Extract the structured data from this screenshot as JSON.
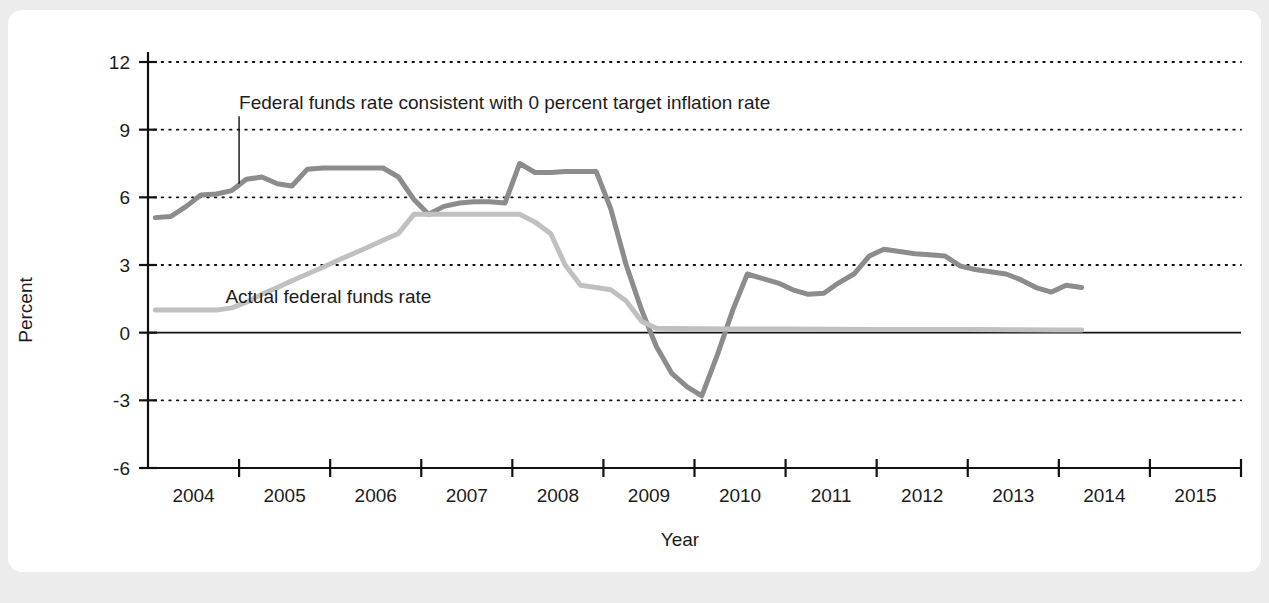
{
  "chart_data": {
    "type": "line",
    "title": "",
    "xlabel": "Year",
    "ylabel": "Percent",
    "grid": true,
    "legend_position": "inline-annotation",
    "xlim": [
      2003.5,
      2015.5
    ],
    "ylim": [
      -6,
      12
    ],
    "x_tick_labels": [
      "2004",
      "2005",
      "2006",
      "2007",
      "2008",
      "2009",
      "2010",
      "2011",
      "2012",
      "2013",
      "2014",
      "2015"
    ],
    "y_tick_labels": [
      "12",
      "9",
      "6",
      "3",
      "0",
      "-3",
      "-6"
    ],
    "y_ticks": [
      12,
      9,
      6,
      3,
      0,
      -3,
      -6
    ],
    "zero_line": 0,
    "series": [
      {
        "name": "Federal funds rate consistent with 0 percent target inflation rate",
        "color": "#8c8c8c",
        "label_x": 2004.5,
        "label_y": 10.2,
        "leader_from": [
          2004.5,
          9.6
        ],
        "leader_to": [
          2004.5,
          6.6
        ],
        "x": [
          2003.58,
          2003.75,
          2003.92,
          2004.08,
          2004.25,
          2004.42,
          2004.58,
          2004.75,
          2004.92,
          2005.08,
          2005.25,
          2005.42,
          2005.58,
          2005.75,
          2005.92,
          2006.08,
          2006.25,
          2006.42,
          2006.58,
          2006.75,
          2006.92,
          2007.08,
          2007.25,
          2007.42,
          2007.58,
          2007.75,
          2007.92,
          2008.08,
          2008.25,
          2008.42,
          2008.58,
          2008.75,
          2008.92,
          2009.08,
          2009.25,
          2009.42,
          2009.58,
          2009.75,
          2009.92,
          2010.08,
          2010.25,
          2010.42,
          2010.58,
          2010.75,
          2010.92,
          2011.08,
          2011.25,
          2011.42,
          2011.58,
          2011.75,
          2011.92,
          2012.08,
          2012.25,
          2012.42,
          2012.58,
          2012.75,
          2012.92,
          2013.08,
          2013.25,
          2013.42,
          2013.58,
          2013.75
        ],
        "y": [
          5.1,
          5.15,
          5.6,
          6.1,
          6.15,
          6.3,
          6.8,
          6.9,
          6.6,
          6.5,
          7.25,
          7.3,
          7.3,
          7.3,
          7.3,
          7.3,
          6.9,
          5.9,
          5.25,
          5.6,
          5.75,
          5.8,
          5.8,
          5.75,
          7.5,
          7.1,
          7.1,
          7.15,
          7.15,
          7.15,
          5.5,
          3.0,
          1.0,
          -0.6,
          -1.8,
          -2.4,
          -2.8,
          -1.0,
          1.0,
          2.6,
          2.4,
          2.2,
          1.9,
          1.7,
          1.75,
          2.2,
          2.6,
          3.4,
          3.7,
          3.6,
          3.5,
          3.45,
          3.4,
          2.95,
          2.8,
          2.7,
          2.6,
          2.35,
          2.0,
          1.8,
          2.1,
          2.0
        ]
      },
      {
        "name": "Actual federal funds rate",
        "color": "#c0c0c0",
        "label_x": 2004.35,
        "label_y": 1.6,
        "x": [
          2003.58,
          2003.92,
          2004.25,
          2004.42,
          2004.58,
          2004.75,
          2004.92,
          2005.08,
          2005.25,
          2005.42,
          2005.58,
          2005.75,
          2005.92,
          2006.08,
          2006.25,
          2006.42,
          2006.58,
          2006.75,
          2006.92,
          2007.08,
          2007.25,
          2007.42,
          2007.58,
          2007.75,
          2007.92,
          2008.08,
          2008.25,
          2008.42,
          2008.58,
          2008.75,
          2008.92,
          2009.08,
          2009.5,
          2010.0,
          2010.5,
          2011.0,
          2011.5,
          2012.0,
          2012.5,
          2013.0,
          2013.5,
          2013.75
        ],
        "y": [
          1.0,
          1.0,
          1.0,
          1.1,
          1.35,
          1.7,
          2.0,
          2.3,
          2.6,
          2.9,
          3.2,
          3.5,
          3.8,
          4.1,
          4.4,
          5.25,
          5.25,
          5.25,
          5.25,
          5.25,
          5.25,
          5.25,
          5.25,
          4.9,
          4.4,
          3.0,
          2.1,
          2.0,
          1.9,
          1.4,
          0.5,
          0.2,
          0.17,
          0.16,
          0.16,
          0.15,
          0.14,
          0.14,
          0.14,
          0.13,
          0.12,
          0.12
        ]
      }
    ]
  },
  "axes": {
    "x_axis_label": "Year",
    "y_axis_label": "Percent"
  }
}
